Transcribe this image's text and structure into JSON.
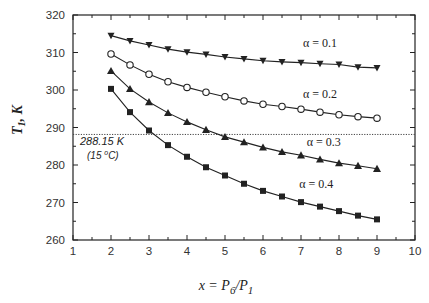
{
  "chart_data": {
    "type": "line",
    "title": "",
    "xlabel": "x = P6/P1",
    "xlabel_parts": {
      "base": "x = P",
      "sub1": "6",
      "mid": "/P",
      "sub2": "1"
    },
    "ylabel": "T1, K",
    "ylabel_parts": {
      "base": "T",
      "sub": "1",
      "rest": ", K"
    },
    "xlim": [
      1,
      10
    ],
    "ylim": [
      260,
      320
    ],
    "xticks": [
      1,
      2,
      3,
      4,
      5,
      6,
      7,
      8,
      9,
      10
    ],
    "yticks": [
      260,
      270,
      280,
      290,
      300,
      310,
      320
    ],
    "xtick_labels": [
      "1",
      "2",
      "3",
      "4",
      "5",
      "6",
      "7",
      "8",
      "9",
      "10"
    ],
    "ytick_labels": [
      "260",
      "270",
      "280",
      "290",
      "300",
      "310",
      "320"
    ],
    "grid": false,
    "x": [
      2,
      2.5,
      3,
      3.5,
      4,
      4.5,
      5,
      5.5,
      6,
      6.5,
      7,
      7.5,
      8,
      8.5,
      9
    ],
    "series": [
      {
        "name": "α = 0.1",
        "marker": "triangle-down",
        "label_pos": [
          7.5,
          311.5
        ],
        "values": [
          314.5,
          313.1,
          312.0,
          310.9,
          310.1,
          309.5,
          308.8,
          308.3,
          307.8,
          307.5,
          307.3,
          307.0,
          306.8,
          306.1,
          305.9
        ]
      },
      {
        "name": "α = 0.2",
        "marker": "circle-open",
        "label_pos": [
          7.5,
          298.0
        ],
        "values": [
          309.6,
          306.7,
          304.2,
          302.2,
          300.7,
          299.4,
          298.2,
          297.1,
          296.2,
          295.6,
          294.9,
          294.1,
          293.4,
          292.9,
          292.5
        ]
      },
      {
        "name": "α = 0.3",
        "marker": "triangle-up",
        "label_pos": [
          7.6,
          285.0
        ],
        "values": [
          305.1,
          300.3,
          296.8,
          293.9,
          291.5,
          289.4,
          287.5,
          286.1,
          284.7,
          283.5,
          282.6,
          281.5,
          280.5,
          279.8,
          279.0
        ]
      },
      {
        "name": "α = 0.4",
        "marker": "square",
        "label_pos": [
          7.4,
          274.0
        ],
        "values": [
          300.3,
          294.1,
          289.2,
          285.3,
          282.2,
          279.4,
          277.2,
          275.0,
          273.1,
          271.6,
          270.1,
          268.9,
          267.7,
          266.5,
          265.5
        ]
      }
    ],
    "reference_line": {
      "y": 288.15,
      "style": "dotted",
      "label": "288.15 K",
      "sublabel_prefix": "(15 ",
      "sublabel_sup": "o",
      "sublabel_suffix": "C)"
    }
  }
}
